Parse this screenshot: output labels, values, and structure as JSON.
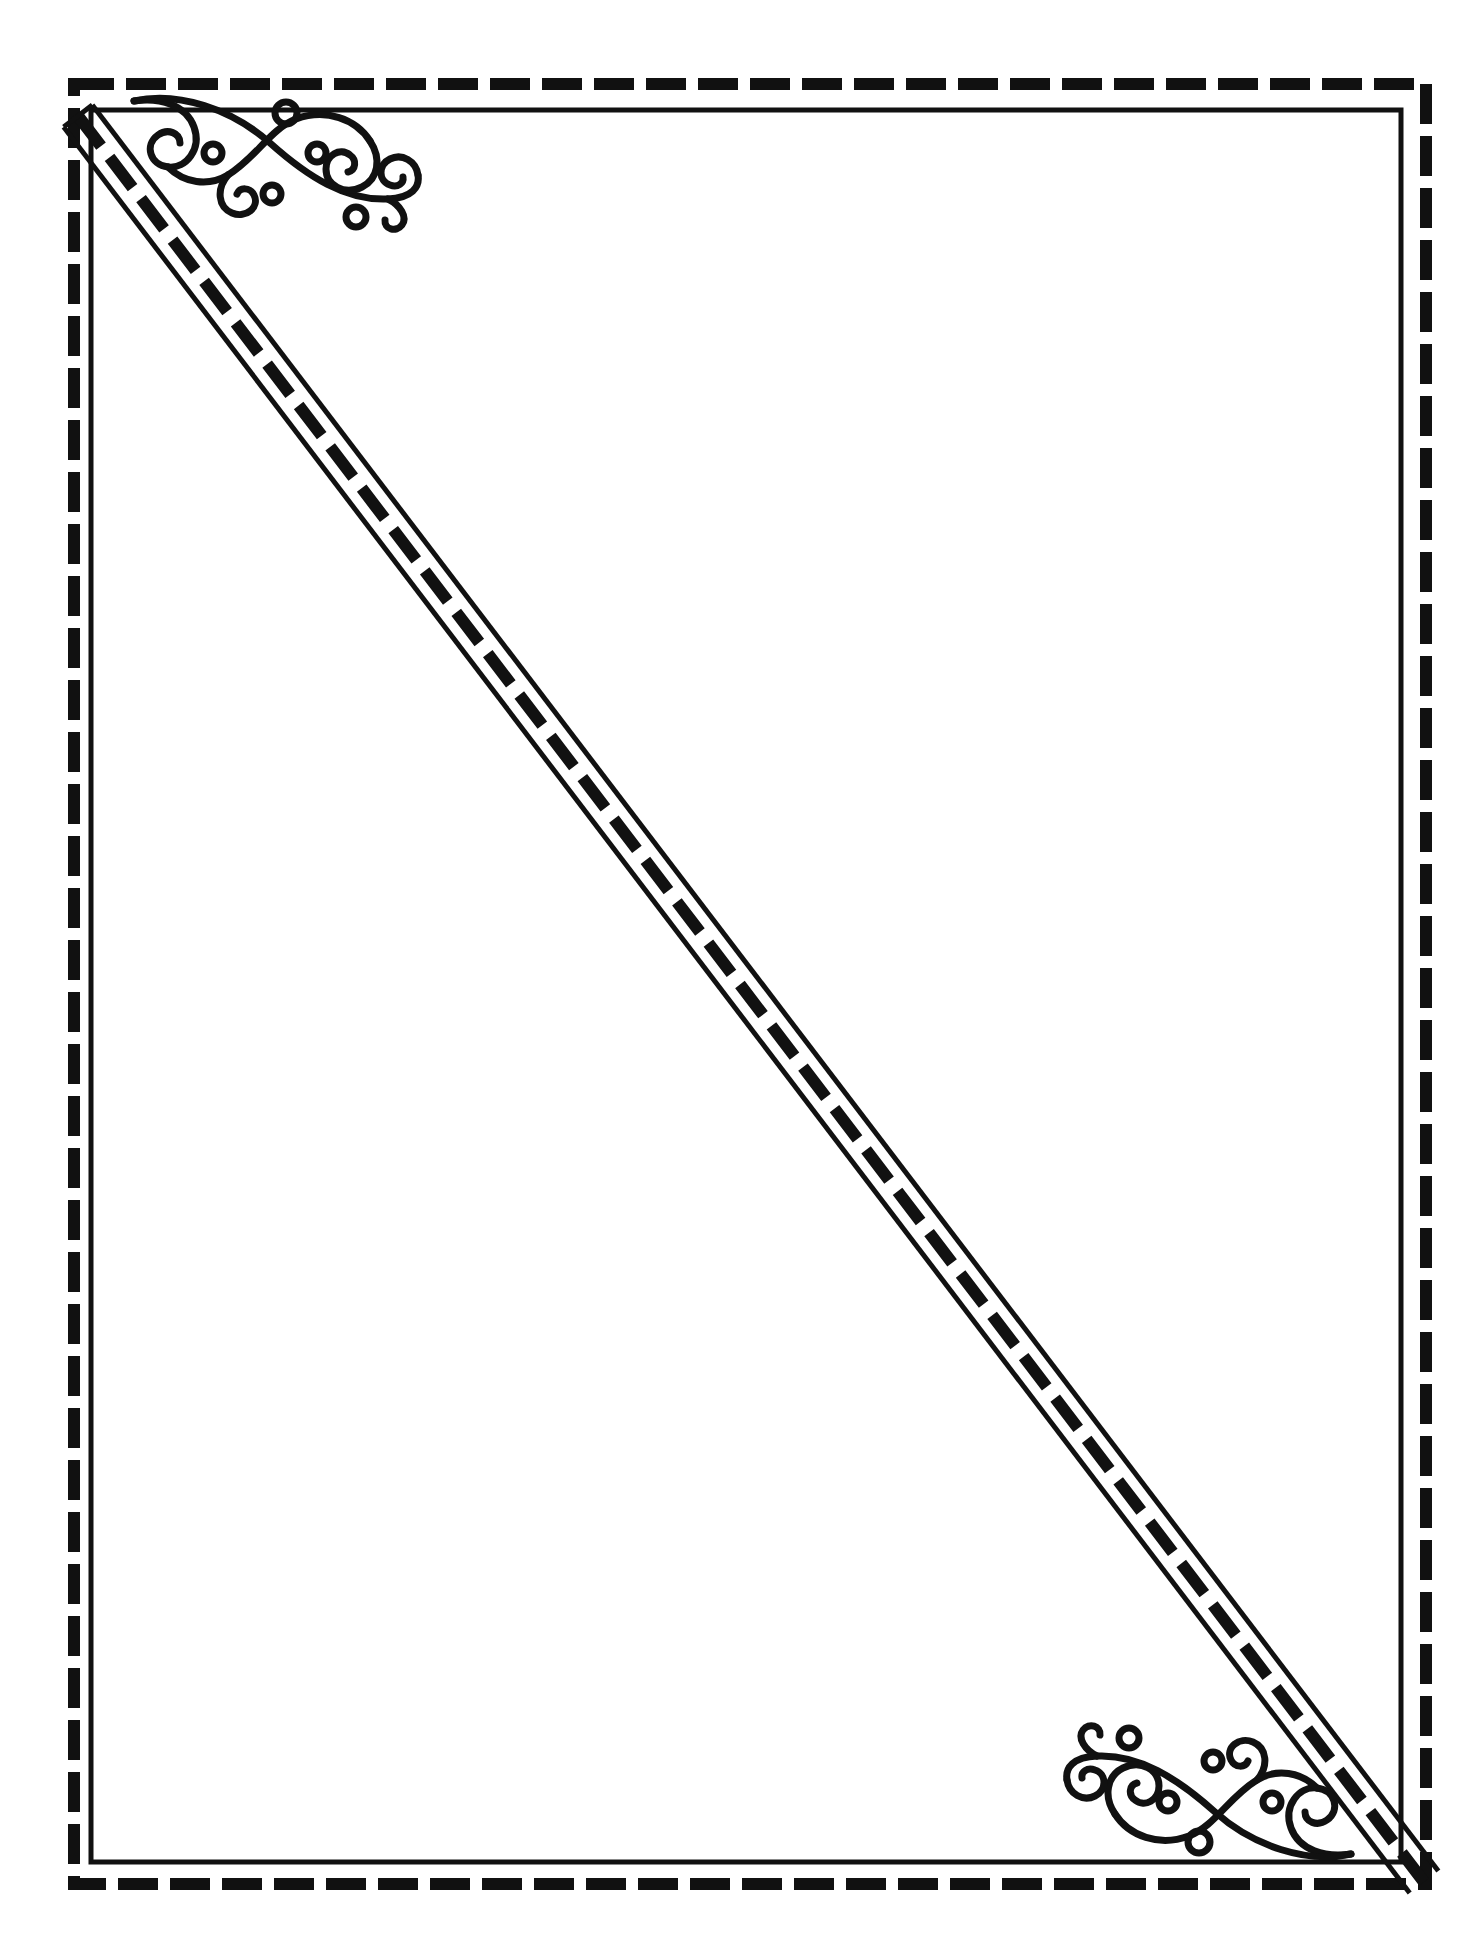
{
  "document": {
    "title": "Decorative Diagonal Frame Border",
    "type": "line-art-border-template",
    "canvas": {
      "width": 1482,
      "height": 1939
    },
    "background_color": "#ffffff",
    "ink_color": "#111111"
  },
  "border": {
    "outer_dashed": {
      "name": "outer-dashed-rectangle",
      "x": 74,
      "y": 84,
      "width": 1352,
      "height": 1800,
      "stroke_color": "#111111",
      "stroke_width": 12,
      "dash_length": 40,
      "gap_length": 12
    },
    "inner_solid": {
      "name": "inner-solid-rectangle",
      "x": 91,
      "y": 110,
      "width": 1310,
      "height": 1752,
      "stroke_color": "#111111",
      "stroke_width": 5
    }
  },
  "diagonal": {
    "name": "diagonal-divider",
    "description": "Triple-rule diagonal from the upper-left corner to the lower-right corner: thin solid rule, dashed rule, thin solid rule",
    "start": {
      "x": 78,
      "y": 116
    },
    "end": {
      "x": 1424,
      "y": 1882
    },
    "solid_stroke_color": "#111111",
    "solid_stroke_width": 5,
    "dash_stroke_color": "#111111",
    "dash_stroke_width": 12,
    "dash_length": 38,
    "gap_length": 14,
    "band_offset": 18
  },
  "ornaments": [
    {
      "name": "flourish-top-left",
      "style": "filigree-scroll-swirl",
      "position": "top-left",
      "anchor": {
        "x": 120,
        "y": 95
      },
      "width": 300,
      "height": 135,
      "stroke_color": "#111111",
      "stroke_width": 7,
      "dot_count": 5
    },
    {
      "name": "flourish-bottom-right",
      "style": "filigree-scroll-swirl",
      "position": "bottom-right",
      "anchor": {
        "x": 1065,
        "y": 1725
      },
      "width": 300,
      "height": 135,
      "stroke_color": "#111111",
      "stroke_width": 7,
      "dot_count": 5,
      "transform": "rotate-180"
    }
  ],
  "content_area": {
    "name": "writable-region",
    "text": "",
    "placeholder": ""
  }
}
